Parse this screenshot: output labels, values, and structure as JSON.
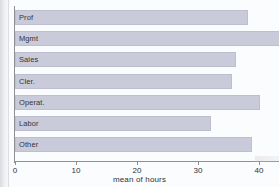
{
  "chart_data": {
    "type": "bar",
    "orientation": "horizontal",
    "title": "",
    "xlabel": "mean of hours",
    "ylabel": "",
    "categories": [
      "Prof",
      "Mgmt",
      "Sales",
      "Cler.",
      "Operat.",
      "Labor",
      "Other"
    ],
    "values": [
      38.2,
      43.5,
      36.2,
      35.6,
      40.1,
      32.1,
      38.9
    ],
    "xlim": [
      0,
      43.5
    ],
    "xticks": [
      0,
      10,
      20,
      30,
      40
    ],
    "xtick_labels": [
      "0",
      "10",
      "20",
      "30",
      "40"
    ],
    "grid": false,
    "legend": null,
    "bar_color": "#c9cbda",
    "bar_edge_color": "#bdbfd0",
    "axis_color": "#8e9096",
    "background": "#fbfcfd"
  },
  "axis": {
    "x_title": "mean of hours"
  }
}
